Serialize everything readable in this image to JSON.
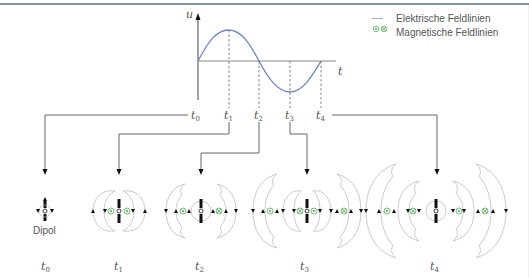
{
  "diagram": {
    "plot": {
      "y_axis_label": "u",
      "x_axis_label": "t",
      "curve_color": "#6f86c2",
      "time_markers": [
        {
          "base": "t",
          "sub": "0"
        },
        {
          "base": "t",
          "sub": "1"
        },
        {
          "base": "t",
          "sub": "2"
        },
        {
          "base": "t",
          "sub": "3"
        },
        {
          "base": "t",
          "sub": "4"
        }
      ]
    },
    "legend": {
      "items": [
        {
          "label": "Elektrische Feldlinien",
          "symbol": "line",
          "color": "#9fb2d6"
        },
        {
          "label": "Magnetische Feldlinien",
          "symbol": "dot-cross",
          "color": "#4caf50"
        }
      ]
    },
    "panels": [
      {
        "time": {
          "base": "t",
          "sub": "0"
        },
        "caption": "Dipol",
        "rings": 0
      },
      {
        "time": {
          "base": "t",
          "sub": "1"
        },
        "caption": "",
        "rings": 1
      },
      {
        "time": {
          "base": "t",
          "sub": "2"
        },
        "caption": "",
        "rings": 1
      },
      {
        "time": {
          "base": "t",
          "sub": "3"
        },
        "caption": "",
        "rings": 2
      },
      {
        "time": {
          "base": "t",
          "sub": "4"
        },
        "caption": "",
        "rings": 2
      }
    ],
    "colors": {
      "header_rule": "#7d93a8",
      "field_line": "#b9bcc2",
      "magnetic": "#4caf50",
      "axis": "#555555"
    }
  }
}
